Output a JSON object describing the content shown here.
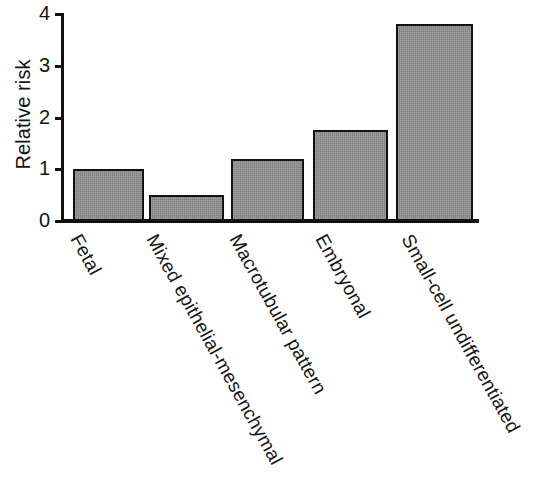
{
  "chart_data": {
    "type": "bar",
    "title": "",
    "subtitle": "",
    "xlabel": "",
    "ylabel": "Relative risk",
    "ylim": [
      0,
      4
    ],
    "yticks": [
      0,
      1,
      2,
      3,
      4
    ],
    "ytick_labels": [
      "0",
      "1",
      "2",
      "3",
      "4"
    ],
    "grid": false,
    "legend": null,
    "orientation": "vertical",
    "categories": [
      "Fetal",
      "Mixed epithelial-mesenchymal",
      "Macrotubular pattern",
      "Embryonal",
      "Small-cell undifferentiated"
    ],
    "values": [
      1.0,
      0.5,
      1.2,
      1.75,
      3.8
    ],
    "series": [
      {
        "name": "Relative risk",
        "values": [
          1.0,
          0.5,
          1.2,
          1.75,
          3.8
        ]
      }
    ],
    "bar_color": "#8b8b8b",
    "bar_edge_color": "#121212",
    "axis_color": "#111111",
    "background_color": "#ffffff",
    "tick_label_rotation_degrees": -61,
    "annotations": []
  },
  "axis": {
    "y_title": "Relative risk"
  }
}
